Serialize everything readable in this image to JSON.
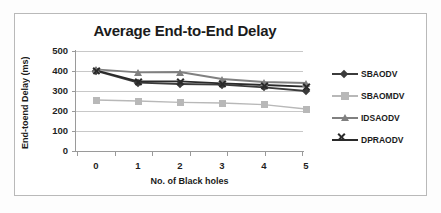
{
  "chart_data": {
    "type": "line",
    "title": "Average End-to-End Delay",
    "xlabel": "No. of Black holes",
    "ylabel": "End-toend Delay (ms)",
    "categories": [
      "0",
      "1",
      "2",
      "3",
      "4",
      "5"
    ],
    "x": [
      0,
      1,
      2,
      3,
      4,
      5
    ],
    "ylim": [
      0,
      500
    ],
    "xlim": [
      0,
      5
    ],
    "yticks": [
      "500",
      "400",
      "300",
      "200",
      "100",
      "0"
    ],
    "ytick_values": [
      500,
      400,
      300,
      200,
      100,
      0
    ],
    "grid": "horizontal",
    "legend_position": "right",
    "series": [
      {
        "name": "SBAODV",
        "values": [
          400,
          342,
          335,
          332,
          318,
          300
        ],
        "color": "#3b3b3b",
        "marker": "diamond"
      },
      {
        "name": "SBAOMDV",
        "values": [
          255,
          250,
          243,
          240,
          232,
          210
        ],
        "color": "#b8b8b8",
        "marker": "square"
      },
      {
        "name": "IDSAODV",
        "values": [
          408,
          393,
          395,
          360,
          345,
          340
        ],
        "color": "#808080",
        "marker": "triangle"
      },
      {
        "name": "DPRAODV",
        "values": [
          403,
          348,
          348,
          338,
          330,
          322
        ],
        "color": "#2a2a2a",
        "marker": "x"
      }
    ]
  },
  "legend": {
    "items": [
      {
        "label": "SBAODV"
      },
      {
        "label": "SBAOMDV"
      },
      {
        "label": "IDSAODV"
      },
      {
        "label": "DPRAODV"
      }
    ]
  },
  "colors": {
    "gridline": "#c8c8c8",
    "axis": "#9a9a9a",
    "frame": "#b9b9b9",
    "text": "#1b1b1b",
    "background": "#ffffff"
  }
}
